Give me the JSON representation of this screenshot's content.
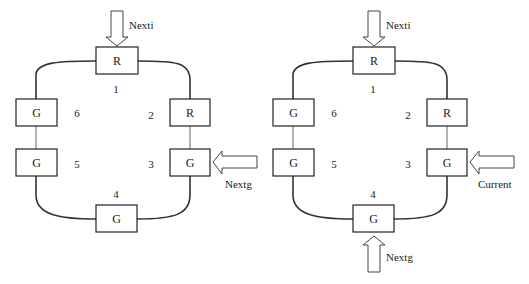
{
  "diagrams": [
    {
      "name": "left",
      "nodes": [
        {
          "id": 1,
          "state": "R"
        },
        {
          "id": 2,
          "state": "R"
        },
        {
          "id": 3,
          "state": "G"
        },
        {
          "id": 4,
          "state": "G"
        },
        {
          "id": 5,
          "state": "G"
        },
        {
          "id": 6,
          "state": "G"
        }
      ],
      "numbers": [
        "1",
        "2",
        "3",
        "4",
        "5",
        "6"
      ],
      "arrows": [
        {
          "label": "Nexti",
          "target_node": 1,
          "direction": "down"
        },
        {
          "label": "Nextg",
          "target_node": 3,
          "direction": "left"
        }
      ]
    },
    {
      "name": "right",
      "nodes": [
        {
          "id": 1,
          "state": "R"
        },
        {
          "id": 2,
          "state": "R"
        },
        {
          "id": 3,
          "state": "G"
        },
        {
          "id": 4,
          "state": "G"
        },
        {
          "id": 5,
          "state": "G"
        },
        {
          "id": 6,
          "state": "G"
        }
      ],
      "numbers": [
        "1",
        "2",
        "3",
        "4",
        "5",
        "6"
      ],
      "arrows": [
        {
          "label": "Nexti",
          "target_node": 1,
          "direction": "down"
        },
        {
          "label": "Current",
          "target_node": 3,
          "direction": "left"
        },
        {
          "label": "Nextg",
          "target_node": 4,
          "direction": "up"
        }
      ]
    }
  ]
}
